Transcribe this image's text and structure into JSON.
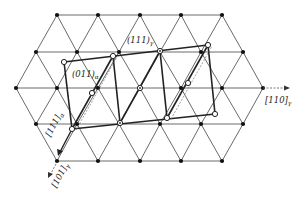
{
  "diagram": {
    "type": "crystallographic-lattice-projection",
    "colors": {
      "line": "#444444",
      "thick": "#222222",
      "background": "#ffffff"
    },
    "lattice": {
      "rows": [
        {
          "y": 15,
          "x": [
            57,
            98,
            140,
            181,
            222
          ]
        },
        {
          "y": 52,
          "x": [
            36,
            77,
            119,
            160,
            201,
            243
          ]
        },
        {
          "y": 88,
          "x": [
            16,
            57,
            98,
            140,
            181,
            222,
            263
          ]
        },
        {
          "y": 124,
          "x": [
            36,
            77,
            119,
            160,
            201,
            243
          ]
        },
        {
          "y": 161,
          "x": [
            57,
            98,
            140,
            181,
            222
          ]
        }
      ]
    },
    "cell_outline": [
      [
        64,
        62
      ],
      [
        113,
        56
      ],
      [
        160,
        51
      ],
      [
        208,
        45
      ],
      [
        215,
        114
      ],
      [
        167,
        118
      ],
      [
        120,
        123
      ],
      [
        72,
        129
      ]
    ],
    "labels": {
      "plane_gamma": {
        "text": "(111)",
        "sub": "γ"
      },
      "plane_alpha": {
        "text": "(011)",
        "sub": "α"
      },
      "dir_110_gamma": {
        "text": "[110]",
        "sub": "γ"
      },
      "dir_111_alpha": {
        "text": "[111]",
        "sub": "α"
      },
      "dir_101_gamma": {
        "text": "[101]",
        "sub": "γ"
      }
    }
  }
}
